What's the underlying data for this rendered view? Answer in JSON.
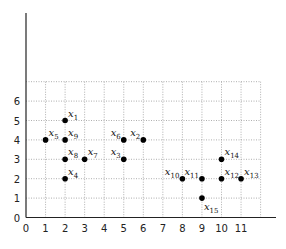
{
  "chart_data": {
    "type": "scatter",
    "title": "",
    "xlabel": "",
    "ylabel": "",
    "xlim": [
      0,
      12
    ],
    "ylim": [
      0,
      7
    ],
    "grid": true,
    "x_ticks": [
      "0",
      "1",
      "2",
      "3",
      "4",
      "5",
      "6",
      "7",
      "8",
      "9",
      "10",
      "11"
    ],
    "y_ticks": [
      "0",
      "1",
      "2",
      "3",
      "4",
      "5",
      "6"
    ],
    "points": [
      {
        "label": "x",
        "sub": "1",
        "x": 2,
        "y": 5,
        "pos": "ne"
      },
      {
        "label": "x",
        "sub": "2",
        "x": 6,
        "y": 4,
        "pos": "nw"
      },
      {
        "label": "x",
        "sub": "3",
        "x": 5,
        "y": 3,
        "pos": "nw"
      },
      {
        "label": "x",
        "sub": "4",
        "x": 2,
        "y": 2,
        "pos": "ne"
      },
      {
        "label": "x",
        "sub": "5",
        "x": 1,
        "y": 4,
        "pos": "ne"
      },
      {
        "label": "x",
        "sub": "6",
        "x": 5,
        "y": 4,
        "pos": "nw"
      },
      {
        "label": "x",
        "sub": "7",
        "x": 3,
        "y": 3,
        "pos": "ne"
      },
      {
        "label": "x",
        "sub": "8",
        "x": 2,
        "y": 3,
        "pos": "ne"
      },
      {
        "label": "x",
        "sub": "9",
        "x": 2,
        "y": 4,
        "pos": "ne"
      },
      {
        "label": "x",
        "sub": "10",
        "x": 8,
        "y": 2,
        "pos": "nw"
      },
      {
        "label": "x",
        "sub": "11",
        "x": 9,
        "y": 2,
        "pos": "nw"
      },
      {
        "label": "x",
        "sub": "12",
        "x": 10,
        "y": 2,
        "pos": "ne"
      },
      {
        "label": "x",
        "sub": "13",
        "x": 11,
        "y": 2,
        "pos": "ne"
      },
      {
        "label": "x",
        "sub": "14",
        "x": 10,
        "y": 3,
        "pos": "ne"
      },
      {
        "label": "x",
        "sub": "15",
        "x": 9,
        "y": 1,
        "pos": "se"
      }
    ]
  }
}
